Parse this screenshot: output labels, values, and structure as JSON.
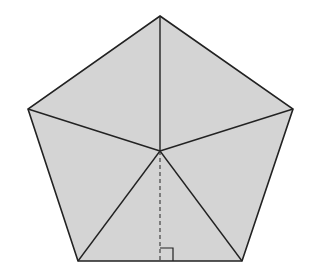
{
  "diagram": {
    "shape": "regular-pentagon",
    "fill_color": "#d4d4d4",
    "stroke_color": "#222222",
    "background_color": "#ffffff",
    "vertices": {
      "top": [
        160,
        16
      ],
      "right": [
        293,
        109
      ],
      "bottom_right": [
        242,
        261
      ],
      "bottom_left": [
        78,
        261
      ],
      "left": [
        28,
        109
      ]
    },
    "center": [
      160,
      151
    ],
    "apothem": {
      "from": [
        160,
        151
      ],
      "to": [
        160,
        261
      ],
      "style": "dashed"
    },
    "right_angle_marker": {
      "corner": [
        160,
        261
      ],
      "size": 13
    },
    "triangle_count": 5
  }
}
